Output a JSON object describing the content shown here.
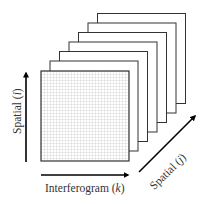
{
  "diagram": {
    "type": "data-cube",
    "frame_count_behind": 6,
    "front_frame": "grid",
    "colors": {
      "stroke": "#222222",
      "grid_line": "#aaaaaa",
      "frame_fill": "#ffffff",
      "arrow": "#000000"
    }
  },
  "axes": {
    "x": {
      "label": "Interferogram",
      "var": "k",
      "direction": "right"
    },
    "y": {
      "label": "Spatial",
      "var": "i",
      "direction": "up"
    },
    "z": {
      "label": "Spatial",
      "var": "j",
      "direction": "diagonal-up-right"
    }
  }
}
